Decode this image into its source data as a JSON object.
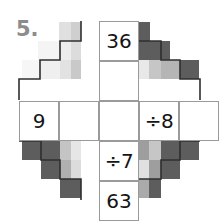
{
  "puzzle": {
    "number_label": "5.",
    "shape": "cross",
    "columns": 5,
    "rows": 5,
    "cell_size": 40,
    "grid_origin": {
      "x": 19,
      "y": 21
    },
    "colors": {
      "label_gray": "#8c8c8c",
      "cell_border": "#9a9a9a",
      "outline_dark": "#3a3a3a",
      "block_dark": "#5d5d5d",
      "block_mid": "#b8b8b8",
      "block_light": "#e3e3e3",
      "block_pale": "#f2f2f2",
      "text": "#141414",
      "background": "#ffffff"
    },
    "cells": [
      {
        "id": "c-r0-c2",
        "row": 0,
        "col": 2,
        "value": "36",
        "kind": "number",
        "visible": true
      },
      {
        "id": "c-r1-c2",
        "row": 1,
        "col": 2,
        "value": "",
        "kind": "blank",
        "visible": true
      },
      {
        "id": "c-r2-c0",
        "row": 2,
        "col": 0,
        "value": "9",
        "kind": "number",
        "visible": true
      },
      {
        "id": "c-r2-c1",
        "row": 2,
        "col": 1,
        "value": "",
        "kind": "blank",
        "visible": true
      },
      {
        "id": "c-r2-c2",
        "row": 2,
        "col": 2,
        "value": "",
        "kind": "blank",
        "visible": true
      },
      {
        "id": "c-r2-c3",
        "row": 2,
        "col": 3,
        "value": "÷8",
        "kind": "operator",
        "visible": true
      },
      {
        "id": "c-r2-c4",
        "row": 2,
        "col": 4,
        "value": "",
        "kind": "blank",
        "visible": true
      },
      {
        "id": "c-r3-c2",
        "row": 3,
        "col": 2,
        "value": "÷7",
        "kind": "operator",
        "visible": true
      },
      {
        "id": "c-r4-c2",
        "row": 4,
        "col": 2,
        "value": "63",
        "kind": "number",
        "visible": true
      }
    ],
    "decorations": [
      {
        "id": "d-tl-1",
        "x": 59,
        "y": 22,
        "w": 12,
        "h": 19,
        "color": "#e0e0e0"
      },
      {
        "id": "d-tl-2",
        "x": 71,
        "y": 22,
        "w": 10,
        "h": 19,
        "color": "#cfcfcf"
      },
      {
        "id": "d-tl-3",
        "x": 38,
        "y": 41,
        "w": 21,
        "h": 19,
        "color": "#f4f4f4"
      },
      {
        "id": "d-tl-4",
        "x": 59,
        "y": 41,
        "w": 12,
        "h": 19,
        "color": "#ededed"
      },
      {
        "id": "d-tl-5",
        "x": 71,
        "y": 41,
        "w": 10,
        "h": 19,
        "color": "#dcdcdc"
      },
      {
        "id": "d-tl-6",
        "x": 22,
        "y": 60,
        "w": 18,
        "h": 19,
        "color": "#f6f6f6"
      },
      {
        "id": "d-tl-7",
        "x": 40,
        "y": 60,
        "w": 20,
        "h": 19,
        "color": "#efefef"
      },
      {
        "id": "d-tl-8",
        "x": 60,
        "y": 60,
        "w": 11,
        "h": 19,
        "color": "#e2e2e2"
      },
      {
        "id": "d-tl-9",
        "x": 71,
        "y": 60,
        "w": 10,
        "h": 19,
        "color": "#c9c9c9"
      },
      {
        "id": "d-tr-1",
        "x": 138,
        "y": 22,
        "w": 12,
        "h": 19,
        "color": "#5d5d5d"
      },
      {
        "id": "d-tr-2",
        "x": 138,
        "y": 41,
        "w": 12,
        "h": 19,
        "color": "#5d5d5d"
      },
      {
        "id": "d-tr-3",
        "x": 150,
        "y": 41,
        "w": 20,
        "h": 19,
        "color": "#5d5d5d"
      },
      {
        "id": "d-tr-4",
        "x": 138,
        "y": 60,
        "w": 11,
        "h": 19,
        "color": "#e8e8e8"
      },
      {
        "id": "d-tr-5",
        "x": 149,
        "y": 60,
        "w": 12,
        "h": 19,
        "color": "#c6c6c6"
      },
      {
        "id": "d-tr-6",
        "x": 161,
        "y": 60,
        "w": 19,
        "h": 19,
        "color": "#b5b5b5"
      },
      {
        "id": "d-tr-7",
        "x": 180,
        "y": 60,
        "w": 19,
        "h": 19,
        "color": "#5d5d5d"
      },
      {
        "id": "d-bl-1",
        "x": 22,
        "y": 141,
        "w": 19,
        "h": 19,
        "color": "#5d5d5d"
      },
      {
        "id": "d-bl-2",
        "x": 41,
        "y": 141,
        "w": 19,
        "h": 19,
        "color": "#5d5d5d"
      },
      {
        "id": "d-bl-3",
        "x": 60,
        "y": 141,
        "w": 11,
        "h": 19,
        "color": "#c4c4c4"
      },
      {
        "id": "d-bl-4",
        "x": 71,
        "y": 141,
        "w": 10,
        "h": 19,
        "color": "#e6e6e6"
      },
      {
        "id": "d-bl-5",
        "x": 41,
        "y": 160,
        "w": 19,
        "h": 19,
        "color": "#5d5d5d"
      },
      {
        "id": "d-bl-6",
        "x": 60,
        "y": 160,
        "w": 11,
        "h": 19,
        "color": "#b0b0b0"
      },
      {
        "id": "d-bl-7",
        "x": 71,
        "y": 160,
        "w": 10,
        "h": 19,
        "color": "#dcdcdc"
      },
      {
        "id": "d-bl-8",
        "x": 60,
        "y": 179,
        "w": 11,
        "h": 19,
        "color": "#5d5d5d"
      },
      {
        "id": "d-bl-9",
        "x": 71,
        "y": 179,
        "w": 10,
        "h": 19,
        "color": "#5d5d5d"
      },
      {
        "id": "d-br-1",
        "x": 138,
        "y": 141,
        "w": 11,
        "h": 19,
        "color": "#9e9e9e"
      },
      {
        "id": "d-br-2",
        "x": 149,
        "y": 141,
        "w": 12,
        "h": 19,
        "color": "#c6c6c6"
      },
      {
        "id": "d-br-3",
        "x": 161,
        "y": 141,
        "w": 19,
        "h": 19,
        "color": "#5d5d5d"
      },
      {
        "id": "d-br-4",
        "x": 180,
        "y": 141,
        "w": 19,
        "h": 19,
        "color": "#5d5d5d"
      },
      {
        "id": "d-br-5",
        "x": 138,
        "y": 160,
        "w": 11,
        "h": 19,
        "color": "#e0e0e0"
      },
      {
        "id": "d-br-6",
        "x": 149,
        "y": 160,
        "w": 12,
        "h": 19,
        "color": "#9e9e9e"
      },
      {
        "id": "d-br-7",
        "x": 161,
        "y": 160,
        "w": 19,
        "h": 19,
        "color": "#5d5d5d"
      },
      {
        "id": "d-br-8",
        "x": 138,
        "y": 179,
        "w": 11,
        "h": 19,
        "color": "#aaaaaa"
      },
      {
        "id": "d-br-9",
        "x": 149,
        "y": 179,
        "w": 12,
        "h": 19,
        "color": "#5d5d5d"
      }
    ]
  }
}
